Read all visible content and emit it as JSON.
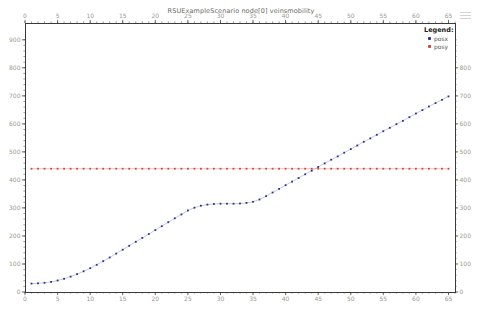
{
  "window": {
    "menu_icon": "hamburger-menu"
  },
  "chart_data": {
    "type": "line",
    "title": "RSUExampleScenario node[0] veinsmobility",
    "legend_title": "Legend:",
    "legend_position": "top-right",
    "grid": false,
    "xlim": [
      0,
      66
    ],
    "ylim_left": [
      0,
      960
    ],
    "x_major_ticks": [
      0,
      5,
      10,
      15,
      20,
      25,
      30,
      35,
      40,
      45,
      50,
      55,
      60,
      65
    ],
    "x_minor_step": 1,
    "y_major_ticks_left": [
      0,
      100,
      200,
      300,
      400,
      500,
      600,
      700,
      800,
      900
    ],
    "y_major_ticks_right": [
      0,
      100,
      200,
      300,
      400,
      500,
      600,
      700,
      800
    ],
    "y_minor_step": 20,
    "axis_color": "#3a3a3a",
    "tick_label_color": "#9a9a90",
    "series": [
      {
        "name": "posx",
        "color": "#2d2d96",
        "line_color": "#9fa6c8",
        "x_start": 1,
        "x_step": 1,
        "values": [
          30,
          31,
          33,
          36,
          41,
          47,
          55,
          64,
          74,
          85,
          97,
          110,
          123,
          137,
          151,
          165,
          179,
          193,
          207,
          221,
          235,
          249,
          263,
          277,
          291,
          301,
          308,
          312,
          314,
          315,
          315,
          315,
          316,
          318,
          322,
          330,
          342,
          355,
          368,
          381,
          394,
          407,
          420,
          433,
          446,
          459,
          472,
          484,
          497,
          510,
          523,
          536,
          548,
          561,
          574,
          586,
          599,
          611,
          624,
          637,
          649,
          662,
          674,
          686,
          698
        ]
      },
      {
        "name": "posy",
        "color": "#d0453a",
        "line_color": "#e39a92",
        "x_start": 1,
        "x_step": 1,
        "values": [
          440,
          440,
          440,
          440,
          440,
          440,
          440,
          440,
          440,
          440,
          440,
          440,
          440,
          440,
          440,
          440,
          440,
          440,
          440,
          440,
          440,
          440,
          440,
          440,
          440,
          440,
          440,
          440,
          440,
          440,
          440,
          440,
          440,
          440,
          440,
          440,
          440,
          440,
          440,
          440,
          440,
          440,
          440,
          440,
          440,
          440,
          440,
          440,
          440,
          440,
          440,
          440,
          440,
          440,
          440,
          440,
          440,
          440,
          440,
          440,
          440,
          440,
          440,
          440,
          440
        ]
      }
    ]
  }
}
